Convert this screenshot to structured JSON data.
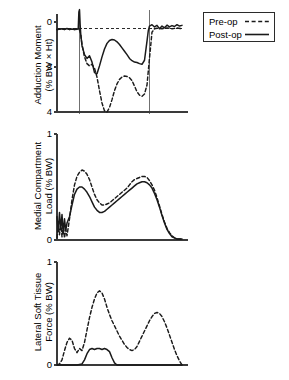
{
  "legend": {
    "name": "legend",
    "entries": [
      {
        "label": "Pre-op",
        "style": "dashed",
        "key": "preop-dashed-key"
      },
      {
        "label": "Post-op",
        "style": "solid",
        "key": "postop-solid-key"
      }
    ]
  },
  "colors": {
    "line": "#1a1a1a",
    "axis": "#3a3a3a",
    "event_line": "#707070",
    "background": "#ffffff"
  },
  "chart_data": [
    {
      "type": "line",
      "panel": 1,
      "title": "",
      "ylabel": "Adduction Moment (% BW × Ht)",
      "ylabel_lines": [
        "Adduction Moment",
        "(% BW × Ht)"
      ],
      "xlabel": "",
      "yticks": [
        0,
        2,
        4
      ],
      "ytick_labels": [
        "0",
        "2",
        "4"
      ],
      "ylim": [
        4,
        0
      ],
      "y_inverted": true,
      "xlim": [
        0,
        100
      ],
      "grid": false,
      "zero_reference_line": {
        "value": 0.3,
        "style": "dashed"
      },
      "event_lines": [
        18,
        74
      ],
      "legend_position": "outside-top-right",
      "series": [
        {
          "name": "Pre-op",
          "style": "dashed",
          "x": [
            0,
            2,
            4,
            6,
            8,
            10,
            12,
            14,
            16,
            17,
            18,
            19,
            20,
            22,
            24,
            26,
            28,
            30,
            32,
            34,
            36,
            38,
            40,
            42,
            44,
            46,
            48,
            50,
            52,
            54,
            56,
            58,
            60,
            62,
            64,
            66,
            68,
            70,
            72,
            74,
            76,
            78,
            80,
            84,
            88,
            92,
            96,
            100
          ],
          "y": [
            0.33,
            0.32,
            0.3,
            0.34,
            0.28,
            0.33,
            0.31,
            0.33,
            0.3,
            0.32,
            0.35,
            0.55,
            1.0,
            1.55,
            1.85,
            1.95,
            1.88,
            2.05,
            2.45,
            3.05,
            3.6,
            3.95,
            4.0,
            3.8,
            3.45,
            3.05,
            2.75,
            2.55,
            2.45,
            2.4,
            2.42,
            2.48,
            2.6,
            2.85,
            3.1,
            3.25,
            3.3,
            3.2,
            2.8,
            1.6,
            0.45,
            0.3,
            0.28,
            0.3,
            0.26,
            0.3,
            0.27,
            0.3
          ]
        },
        {
          "name": "Post-op",
          "style": "solid",
          "x": [
            0,
            2,
            4,
            6,
            8,
            10,
            12,
            14,
            16,
            17,
            17.5,
            18,
            18.5,
            19,
            20,
            21,
            22,
            24,
            26,
            28,
            30,
            32,
            34,
            36,
            38,
            40,
            42,
            44,
            46,
            48,
            50,
            52,
            54,
            56,
            58,
            60,
            62,
            64,
            66,
            68,
            70,
            72,
            73,
            74,
            76,
            78,
            80,
            82,
            84,
            86,
            88,
            90,
            92,
            94,
            96,
            98,
            100
          ],
          "y": [
            0.33,
            0.31,
            0.3,
            0.32,
            0.29,
            0.33,
            0.31,
            0.33,
            0.32,
            0.3,
            -0.45,
            -0.55,
            0.1,
            0.55,
            1.05,
            1.25,
            1.45,
            1.62,
            1.5,
            1.78,
            2.25,
            2.3,
            1.95,
            1.55,
            1.2,
            0.95,
            0.82,
            0.78,
            0.8,
            0.88,
            1.0,
            1.15,
            1.3,
            1.45,
            1.62,
            1.72,
            1.78,
            1.8,
            1.85,
            1.88,
            1.7,
            0.85,
            0.4,
            0.18,
            0.12,
            0.22,
            0.15,
            0.3,
            0.18,
            0.26,
            0.14,
            0.22,
            0.16,
            0.2,
            0.12,
            0.18,
            0.15
          ]
        }
      ]
    },
    {
      "type": "line",
      "panel": 2,
      "title": "",
      "ylabel": "Medial Compartment Load (% BW)",
      "ylabel_lines": [
        "Medial Compartment",
        "Load (% BW)"
      ],
      "xlabel": "",
      "yticks": [
        0,
        1
      ],
      "ytick_labels": [
        "0",
        "1"
      ],
      "ylim": [
        0,
        1
      ],
      "y_inverted": false,
      "xlim": [
        0,
        100
      ],
      "grid": false,
      "event_lines": [],
      "series": [
        {
          "name": "Pre-op",
          "style": "dashed",
          "x": [
            0,
            1,
            2,
            3,
            4,
            5,
            6,
            7,
            8,
            10,
            12,
            14,
            16,
            18,
            20,
            22,
            24,
            26,
            28,
            30,
            32,
            34,
            36,
            38,
            40,
            42,
            44,
            46,
            48,
            50,
            52,
            54,
            56,
            58,
            60,
            62,
            64,
            66,
            68,
            70,
            72,
            74,
            76,
            78,
            80,
            82,
            84,
            86,
            88,
            90,
            92,
            94,
            96,
            98,
            100
          ],
          "y": [
            0.02,
            0.12,
            0.05,
            0.16,
            0.03,
            0.14,
            0.02,
            0.1,
            0.04,
            0.2,
            0.38,
            0.52,
            0.6,
            0.64,
            0.66,
            0.65,
            0.62,
            0.57,
            0.5,
            0.43,
            0.38,
            0.35,
            0.33,
            0.33,
            0.34,
            0.35,
            0.37,
            0.39,
            0.41,
            0.43,
            0.45,
            0.47,
            0.49,
            0.52,
            0.55,
            0.57,
            0.58,
            0.59,
            0.6,
            0.6,
            0.59,
            0.56,
            0.52,
            0.47,
            0.4,
            0.32,
            0.24,
            0.17,
            0.11,
            0.07,
            0.04,
            0.02,
            0.01,
            0.01,
            0.01
          ]
        },
        {
          "name": "Post-op",
          "style": "solid",
          "x": [
            0,
            1,
            2,
            3,
            4,
            5,
            6,
            7,
            8,
            10,
            12,
            14,
            16,
            18,
            20,
            22,
            24,
            26,
            28,
            30,
            32,
            34,
            36,
            38,
            40,
            42,
            44,
            46,
            48,
            50,
            52,
            54,
            56,
            58,
            60,
            62,
            64,
            66,
            68,
            70,
            72,
            74,
            76,
            78,
            80,
            82,
            84,
            86,
            88,
            90,
            92,
            94,
            96,
            98,
            100
          ],
          "y": [
            0.22,
            0.08,
            0.26,
            0.1,
            0.24,
            0.06,
            0.2,
            0.09,
            0.16,
            0.22,
            0.33,
            0.43,
            0.48,
            0.5,
            0.5,
            0.48,
            0.45,
            0.41,
            0.36,
            0.31,
            0.28,
            0.26,
            0.26,
            0.27,
            0.29,
            0.31,
            0.33,
            0.35,
            0.37,
            0.39,
            0.41,
            0.43,
            0.45,
            0.47,
            0.49,
            0.51,
            0.53,
            0.54,
            0.55,
            0.55,
            0.54,
            0.52,
            0.49,
            0.44,
            0.38,
            0.31,
            0.23,
            0.16,
            0.1,
            0.06,
            0.03,
            0.02,
            0.01,
            0.01,
            0.01
          ]
        }
      ]
    },
    {
      "type": "line",
      "panel": 3,
      "title": "",
      "ylabel": "Lateral Soft Tissue Force (% BW)",
      "ylabel_lines": [
        "Lateral Soft Tissue",
        "Force (% BW)"
      ],
      "xlabel": "",
      "yticks": [
        0,
        1
      ],
      "ytick_labels": [
        "0",
        "1"
      ],
      "ylim": [
        0,
        1
      ],
      "y_inverted": false,
      "xlim": [
        0,
        100
      ],
      "grid": false,
      "event_lines": [],
      "series": [
        {
          "name": "Pre-op",
          "style": "dashed",
          "x": [
            0,
            2,
            4,
            6,
            8,
            10,
            12,
            14,
            16,
            18,
            20,
            22,
            24,
            26,
            28,
            30,
            32,
            34,
            36,
            38,
            40,
            42,
            44,
            46,
            48,
            50,
            52,
            54,
            56,
            58,
            60,
            62,
            64,
            66,
            68,
            70,
            72,
            74,
            76,
            78,
            80,
            82,
            84,
            86,
            88,
            90,
            92,
            94,
            96,
            98,
            100
          ],
          "y": [
            0.0,
            0.01,
            0.05,
            0.14,
            0.22,
            0.26,
            0.24,
            0.16,
            0.12,
            0.16,
            0.14,
            0.22,
            0.34,
            0.46,
            0.56,
            0.64,
            0.7,
            0.72,
            0.7,
            0.64,
            0.56,
            0.49,
            0.43,
            0.38,
            0.33,
            0.28,
            0.24,
            0.2,
            0.17,
            0.15,
            0.14,
            0.15,
            0.18,
            0.23,
            0.28,
            0.33,
            0.38,
            0.43,
            0.47,
            0.5,
            0.51,
            0.5,
            0.47,
            0.42,
            0.36,
            0.29,
            0.22,
            0.15,
            0.09,
            0.04,
            0.0
          ]
        },
        {
          "name": "Post-op",
          "style": "solid",
          "x": [
            0,
            4,
            8,
            12,
            16,
            20,
            22,
            24,
            26,
            28,
            30,
            32,
            34,
            36,
            38,
            40,
            42,
            44,
            46,
            48,
            52,
            56,
            60,
            64,
            68,
            72,
            76,
            80,
            84,
            88,
            92,
            96,
            100
          ],
          "y": [
            0.0,
            0.0,
            0.0,
            0.0,
            0.0,
            0.01,
            0.05,
            0.11,
            0.15,
            0.16,
            0.15,
            0.16,
            0.16,
            0.15,
            0.16,
            0.15,
            0.13,
            0.07,
            0.02,
            0.0,
            0.0,
            0.0,
            0.0,
            0.0,
            0.0,
            0.0,
            0.0,
            0.0,
            0.0,
            0.0,
            0.0,
            0.0,
            0.0
          ]
        }
      ]
    }
  ]
}
